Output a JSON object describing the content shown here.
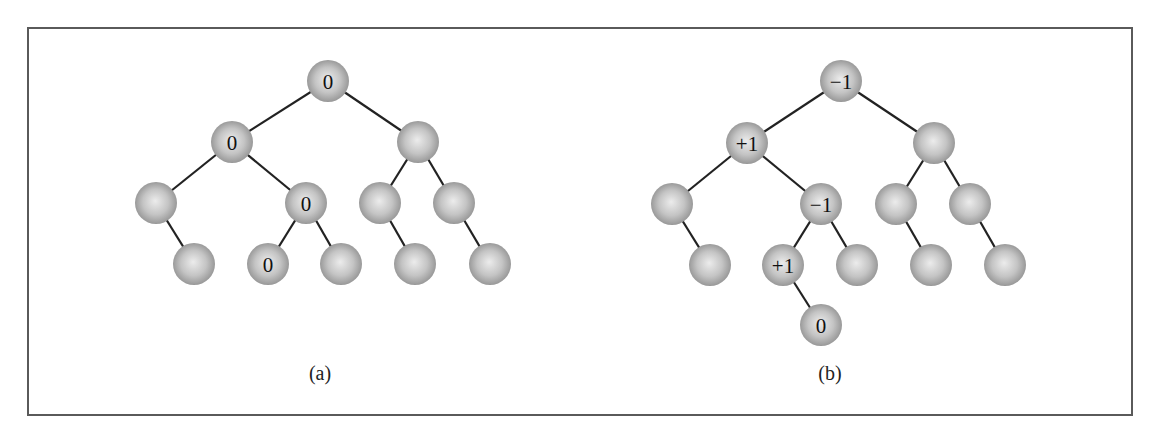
{
  "figure": {
    "node_radius": 21,
    "colors": {
      "frame": "#5a5a5a",
      "edge": "#222222",
      "node_highlight": "#ececec",
      "node_mid": "#c4c4c4",
      "node_edge": "#8e8e8e",
      "label": "#111111"
    },
    "trees": [
      {
        "id": "a",
        "caption": "(a)",
        "caption_pos": {
          "x": 320,
          "y": 362
        },
        "nodes": [
          {
            "id": "a0",
            "x": 328,
            "y": 81,
            "label": "0"
          },
          {
            "id": "a1",
            "x": 232,
            "y": 142,
            "label": "0"
          },
          {
            "id": "a2",
            "x": 418,
            "y": 142,
            "label": ""
          },
          {
            "id": "a3",
            "x": 156,
            "y": 203,
            "label": ""
          },
          {
            "id": "a4",
            "x": 306,
            "y": 203,
            "label": "0"
          },
          {
            "id": "a5",
            "x": 380,
            "y": 203,
            "label": ""
          },
          {
            "id": "a6",
            "x": 454,
            "y": 203,
            "label": ""
          },
          {
            "id": "a7",
            "x": 194,
            "y": 264,
            "label": ""
          },
          {
            "id": "a8",
            "x": 268,
            "y": 264,
            "label": "0"
          },
          {
            "id": "a9",
            "x": 341,
            "y": 264,
            "label": ""
          },
          {
            "id": "a10",
            "x": 415,
            "y": 264,
            "label": ""
          },
          {
            "id": "a11",
            "x": 490,
            "y": 264,
            "label": ""
          }
        ],
        "edges": [
          [
            "a0",
            "a1"
          ],
          [
            "a0",
            "a2"
          ],
          [
            "a1",
            "a3"
          ],
          [
            "a1",
            "a4"
          ],
          [
            "a2",
            "a5"
          ],
          [
            "a2",
            "a6"
          ],
          [
            "a3",
            "a7"
          ],
          [
            "a4",
            "a8"
          ],
          [
            "a4",
            "a9"
          ],
          [
            "a5",
            "a10"
          ],
          [
            "a6",
            "a11"
          ]
        ]
      },
      {
        "id": "b",
        "caption": "(b)",
        "caption_pos": {
          "x": 830,
          "y": 362
        },
        "nodes": [
          {
            "id": "b0",
            "x": 841,
            "y": 81,
            "label": "−1"
          },
          {
            "id": "b1",
            "x": 747,
            "y": 143,
            "label": "+1"
          },
          {
            "id": "b2",
            "x": 934,
            "y": 143,
            "label": ""
          },
          {
            "id": "b3",
            "x": 672,
            "y": 204,
            "label": ""
          },
          {
            "id": "b4",
            "x": 821,
            "y": 204,
            "label": "−1"
          },
          {
            "id": "b5",
            "x": 896,
            "y": 204,
            "label": ""
          },
          {
            "id": "b6",
            "x": 970,
            "y": 204,
            "label": ""
          },
          {
            "id": "b7",
            "x": 710,
            "y": 265,
            "label": ""
          },
          {
            "id": "b8",
            "x": 783,
            "y": 265,
            "label": "+1"
          },
          {
            "id": "b9",
            "x": 857,
            "y": 265,
            "label": ""
          },
          {
            "id": "b10",
            "x": 931,
            "y": 265,
            "label": ""
          },
          {
            "id": "b11",
            "x": 1005,
            "y": 265,
            "label": ""
          },
          {
            "id": "b12",
            "x": 821,
            "y": 325,
            "label": "0"
          }
        ],
        "edges": [
          [
            "b0",
            "b1"
          ],
          [
            "b0",
            "b2"
          ],
          [
            "b1",
            "b3"
          ],
          [
            "b1",
            "b4"
          ],
          [
            "b2",
            "b5"
          ],
          [
            "b2",
            "b6"
          ],
          [
            "b3",
            "b7"
          ],
          [
            "b4",
            "b8"
          ],
          [
            "b4",
            "b9"
          ],
          [
            "b5",
            "b10"
          ],
          [
            "b6",
            "b11"
          ],
          [
            "b8",
            "b12"
          ]
        ]
      }
    ]
  }
}
